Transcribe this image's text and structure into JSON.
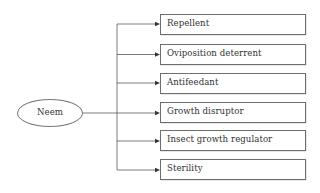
{
  "diagram": {
    "root": {
      "label": "Neem"
    },
    "branches": [
      {
        "label": "Repellent"
      },
      {
        "label": "Oviposition deterrent"
      },
      {
        "label": "Antifeedant"
      },
      {
        "label": "Growth disruptor"
      },
      {
        "label": "Insect growth regulator"
      },
      {
        "label": "Sterility"
      }
    ]
  },
  "colors": {
    "line": "#5a5a5a",
    "border": "#6e6e6e",
    "text": "#333333",
    "background": "#ffffff"
  }
}
